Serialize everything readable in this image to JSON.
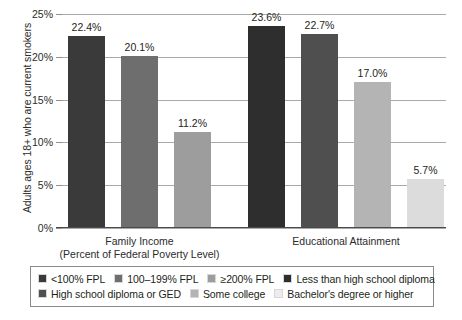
{
  "chart_data": {
    "type": "bar",
    "title": "",
    "subtitle": "",
    "xlabel": "",
    "ylabel": "Adults ages 18+ who are current smokers",
    "ylim": [
      0,
      25
    ],
    "ytick_labels": [
      "0%",
      "5%",
      "10%",
      "15%",
      "20%",
      "25%"
    ],
    "ytick_values": [
      0,
      5,
      10,
      15,
      20,
      25
    ],
    "grid": true,
    "legend_position": "bottom",
    "value_label_suffix": "%",
    "groups": [
      {
        "name": "Family Income",
        "label_line1": "Family Income",
        "label_line2": "(Percent of Federal Poverty Level)"
      },
      {
        "name": "Educational Attainment",
        "label_line1": "Educational Attainment",
        "label_line2": ""
      }
    ],
    "categories": [
      "<100% FPL",
      "100–199% FPL",
      "≥200% FPL",
      "Less than high school diploma",
      "High school diploma or GED",
      "Some college",
      "Bachelor's degree or higher"
    ],
    "bars": [
      {
        "category": "<100% FPL",
        "group": "Family Income",
        "value": 22.4,
        "label": "22.4%",
        "color": "#3a3a3a"
      },
      {
        "category": "100–199% FPL",
        "group": "Family Income",
        "value": 20.1,
        "label": "20.1%",
        "color": "#6e6e6e"
      },
      {
        "category": "≥200% FPL",
        "group": "Family Income",
        "value": 11.2,
        "label": "11.2%",
        "color": "#9d9d9d"
      },
      {
        "category": "Less than high school diploma",
        "group": "Educational Attainment",
        "value": 23.6,
        "label": "23.6%",
        "color": "#2e2e2e"
      },
      {
        "category": "High school diploma or GED",
        "group": "Educational Attainment",
        "value": 22.7,
        "label": "22.7%",
        "color": "#4f4f4f"
      },
      {
        "category": "Some college",
        "group": "Educational Attainment",
        "value": 17.0,
        "label": "17.0%",
        "color": "#b4b4b4"
      },
      {
        "category": "Bachelor's degree or higher",
        "group": "Educational Attainment",
        "value": 5.7,
        "label": "5.7%",
        "color": "#dcdcdc"
      }
    ],
    "legend": {
      "row1": [
        {
          "label": "<100% FPL",
          "color": "#3a3a3a"
        },
        {
          "label": "100–199% FPL",
          "color": "#6e6e6e"
        },
        {
          "label": "≥200% FPL",
          "color": "#9d9d9d"
        },
        {
          "label": "Less than high school diploma",
          "color": "#2e2e2e"
        }
      ],
      "row2": [
        {
          "label": "High school diploma or GED",
          "color": "#4f4f4f"
        },
        {
          "label": "Some college",
          "color": "#b4b4b4"
        },
        {
          "label": "Bachelor's degree or higher",
          "color": "#ececec"
        }
      ]
    }
  }
}
